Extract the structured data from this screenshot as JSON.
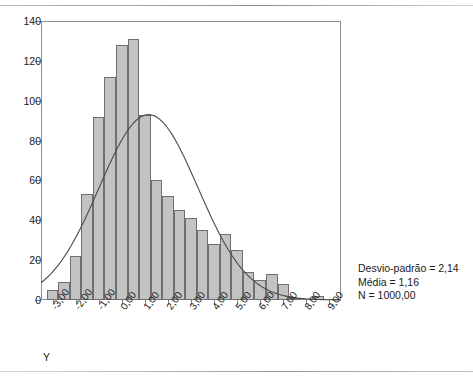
{
  "chart_data": {
    "type": "bar",
    "subtype": "histogram-with-normal-curve",
    "title": "",
    "xlabel": "Y",
    "ylabel": "",
    "xlim": [
      -3.5,
      9.5
    ],
    "ylim": [
      0,
      140
    ],
    "bin_width": 0.5,
    "grid": false,
    "legend": "none",
    "x_tick_labels": [
      "-3,00",
      "-2,00",
      "-1,00",
      "0,00",
      "1,00",
      "2,00",
      "3,00",
      "4,00",
      "5,00",
      "6,00",
      "7,00",
      "8,00",
      "9,00"
    ],
    "x_tick_values": [
      -3,
      -2,
      -1,
      0,
      1,
      2,
      3,
      4,
      5,
      6,
      7,
      8,
      9
    ],
    "y_tick_labels": [
      "0",
      "20",
      "40",
      "60",
      "80",
      "100",
      "120",
      "140"
    ],
    "y_tick_values": [
      0,
      20,
      40,
      60,
      80,
      100,
      120,
      140
    ],
    "bin_left_edges": [
      -3.25,
      -2.75,
      -2.25,
      -1.75,
      -1.25,
      -0.75,
      -0.25,
      0.25,
      0.75,
      1.25,
      1.75,
      2.25,
      2.75,
      3.25,
      3.75,
      4.25,
      4.75,
      5.25,
      5.75,
      6.25,
      6.75,
      7.25,
      7.75,
      8.25
    ],
    "categories": [
      "-3.25",
      "-2.75",
      "-2.25",
      "-1.75",
      "-1.25",
      "-0.75",
      "-0.25",
      "0.25",
      "0.75",
      "1.25",
      "1.75",
      "2.25",
      "2.75",
      "3.25",
      "3.75",
      "4.25",
      "4.75",
      "5.25",
      "5.75",
      "6.25",
      "6.75",
      "7.25",
      "7.75",
      "8.25"
    ],
    "values": [
      5,
      9,
      22,
      53,
      92,
      112,
      128,
      131,
      93,
      60,
      52,
      45,
      41,
      35,
      28,
      33,
      25,
      14,
      10,
      13,
      8,
      1,
      0,
      2
    ],
    "overlay_curve": {
      "name": "normal",
      "mean": 1.16,
      "std_dev": 2.14,
      "n": 1000,
      "peak_value": 93
    }
  },
  "stats": {
    "std_dev_line": "Desvio-padrão = 2,14",
    "mean_line": "Média = 1,16",
    "n_line": "N = 1000,00"
  },
  "axis": {
    "x_title": "Y"
  }
}
